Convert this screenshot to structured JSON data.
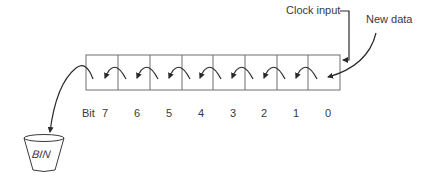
{
  "diagram": {
    "type": "shift-register",
    "labels": {
      "clock_input": "Clock input",
      "new_data": "New data",
      "bit_prefix": "Bit",
      "bin": "BIN"
    },
    "register": {
      "cells": 8,
      "bits": [
        "7",
        "6",
        "5",
        "4",
        "3",
        "2",
        "1",
        "0"
      ],
      "shift_direction": "left"
    },
    "flows": [
      {
        "from": "New data",
        "to": "Bit 0"
      },
      {
        "from": "Bit 0",
        "to": "Bit 1"
      },
      {
        "from": "Bit 1",
        "to": "Bit 2"
      },
      {
        "from": "Bit 2",
        "to": "Bit 3"
      },
      {
        "from": "Bit 3",
        "to": "Bit 4"
      },
      {
        "from": "Bit 4",
        "to": "Bit 5"
      },
      {
        "from": "Bit 5",
        "to": "Bit 6"
      },
      {
        "from": "Bit 6",
        "to": "Bit 7"
      },
      {
        "from": "Bit 7",
        "to": "BIN"
      },
      {
        "from": "Clock input",
        "to": "register"
      }
    ],
    "colors": {
      "line": "#3a3a3a",
      "box": "#6e6e6e",
      "background": "#ffffff"
    }
  }
}
